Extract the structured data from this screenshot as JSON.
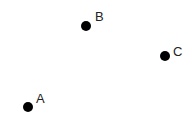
{
  "points": [
    {
      "label": "A",
      "x": 28,
      "y": 107
    },
    {
      "label": "B",
      "x": 86,
      "y": 26
    },
    {
      "label": "C",
      "x": 165,
      "y": 56
    }
  ],
  "colors": {
    "dot": "#000000",
    "label": "#222222",
    "background": "#ffffff"
  }
}
